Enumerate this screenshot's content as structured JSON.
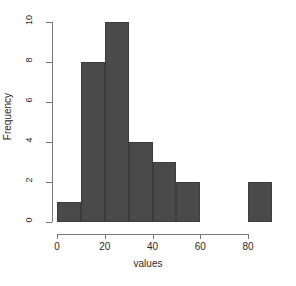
{
  "chart_data": {
    "type": "bar",
    "title": "",
    "subtitle": "",
    "xlabel": "values",
    "ylabel": "Frequency",
    "bin_width": 10,
    "categories": [
      "0-10",
      "10-20",
      "20-30",
      "30-40",
      "40-50",
      "50-60",
      "60-70",
      "70-80",
      "80-90"
    ],
    "bin_starts": [
      0,
      10,
      20,
      30,
      40,
      50,
      60,
      70,
      80
    ],
    "bin_ends": [
      10,
      20,
      30,
      40,
      50,
      60,
      70,
      80,
      90
    ],
    "values": [
      1,
      8,
      10,
      4,
      3,
      2,
      0,
      0,
      2
    ],
    "xlim": [
      0,
      90
    ],
    "ylim": [
      0,
      10
    ],
    "xticks": [
      0,
      20,
      40,
      60,
      80
    ],
    "xtick_labels": [
      "0",
      "20",
      "40",
      "60",
      "80"
    ],
    "yticks": [
      0,
      2,
      4,
      6,
      8,
      10
    ],
    "ytick_labels": [
      "0",
      "2",
      "4",
      "6",
      "8",
      "10"
    ],
    "grid": false,
    "legend": false,
    "legend_position": "none",
    "bar_color": "#4a4a4a",
    "bar_border_color": "#3c3c3c",
    "axis_color": "#777777",
    "text_color": "#2b2b2b",
    "background_color": "#ffffff"
  }
}
